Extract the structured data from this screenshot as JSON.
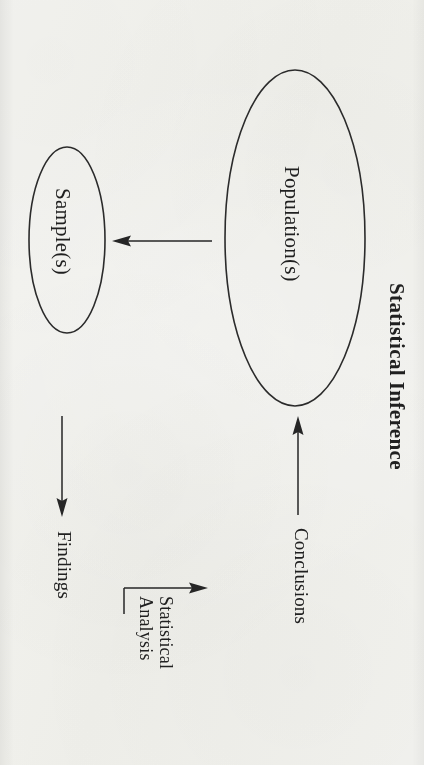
{
  "document": {
    "title": "Statistical Inference",
    "orientation": "rotated-90-clockwise",
    "background_color": "#f8f8f6",
    "ink_color": "#262626"
  },
  "diagram": {
    "type": "flow-diagram",
    "heading": "Statistical Inference",
    "nodes": [
      {
        "id": "population",
        "label": "Population(s)",
        "shape": "ellipse"
      },
      {
        "id": "sample",
        "label": "Sample(s)",
        "shape": "ellipse"
      },
      {
        "id": "findings",
        "label": "Findings",
        "shape": "text"
      }
    ],
    "edges": [
      {
        "id": "sampling",
        "from": "population",
        "to": "sample",
        "label": ""
      },
      {
        "id": "analysis",
        "from": "sample",
        "to": "findings",
        "label": ""
      },
      {
        "id": "statistical-analysis",
        "from": "findings",
        "to": "conclusions",
        "label_line_1": "Statistical",
        "label_line_2": "Analysis"
      },
      {
        "id": "conclusions",
        "from": "findings",
        "to": "population",
        "label": "Conclusions"
      }
    ],
    "labels": {
      "population": "Population(s)",
      "sample": "Sample(s)",
      "findings": "Findings",
      "conclusions": "Conclusions",
      "statistical_analysis_line1": "Statistical",
      "statistical_analysis_line2": "Analysis",
      "heading": "Statistical Inference"
    }
  }
}
